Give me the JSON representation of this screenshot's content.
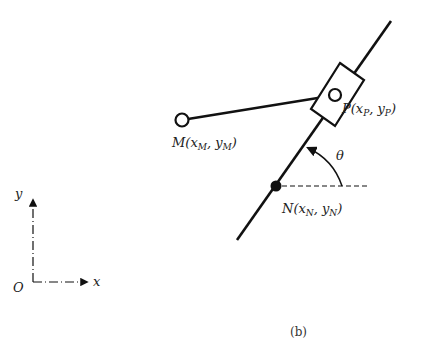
{
  "diagram": {
    "caption": "(b)",
    "points": {
      "M": {
        "label": "M(x",
        "sub1": "M",
        "mid": ", y",
        "sub2": "M",
        "end": ")"
      },
      "P": {
        "label": "P(x",
        "sub1": "P",
        "mid": ", y",
        "sub2": "P",
        "end": ")"
      },
      "N": {
        "label": "N(x",
        "sub1": "N",
        "mid": ", y",
        "sub2": "N",
        "end": ")"
      }
    },
    "angle_label": "θ",
    "axes": {
      "origin": "O",
      "x": "x",
      "y": "y"
    },
    "colors": {
      "stroke": "#111111",
      "background": "#ffffff"
    }
  }
}
